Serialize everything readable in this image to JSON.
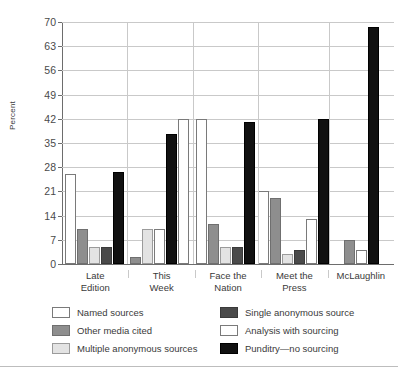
{
  "chart_data": {
    "type": "bar",
    "title_visible_fragment": "",
    "xlabel": "",
    "ylabel": "Percent",
    "ylim": [
      0,
      70
    ],
    "yticks": [
      0,
      7,
      14,
      21,
      28,
      35,
      42,
      49,
      56,
      63,
      70
    ],
    "grid": true,
    "legend_position": "bottom",
    "categories": [
      "Late Edition",
      "This Week",
      "Face the Nation",
      "Meet the Press",
      "McLaughlin"
    ],
    "series": [
      {
        "name": "Named sources",
        "color": "#ffffff",
        "values": [
          26,
          42,
          42,
          21,
          0
        ]
      },
      {
        "name": "Other media cited",
        "color": "#8e8e8e",
        "values": [
          10,
          2,
          11.5,
          19,
          7
        ]
      },
      {
        "name": "Multiple anonymous sources",
        "color": "#e3e3e3",
        "values": [
          5,
          10,
          5,
          3,
          0
        ]
      },
      {
        "name": "Single anonymous source",
        "color": "#4a4a4a",
        "values": [
          5,
          0,
          5,
          4,
          0
        ]
      },
      {
        "name": "Analysis with sourcing",
        "color": "#ffffff",
        "values": [
          0,
          10,
          0,
          13,
          4
        ]
      },
      {
        "name": "Punditry—no sourcing",
        "color": "#111111",
        "values": [
          26.5,
          37.5,
          41,
          42,
          68.5
        ]
      }
    ],
    "groups": [
      {
        "label": "Late Edition",
        "label_lines": [
          "Late",
          "Edition"
        ],
        "bars": [
          {
            "series": "Named sources",
            "value": 26,
            "swatch": "sw-named"
          },
          {
            "series": "Other media cited",
            "value": 10,
            "swatch": "sw-other"
          },
          {
            "series": "Multiple anonymous sources",
            "value": 5,
            "swatch": "sw-multi"
          },
          {
            "series": "Single anonymous source",
            "value": 5,
            "swatch": "sw-single"
          },
          {
            "series": "Punditry—no sourcing",
            "value": 26.5,
            "swatch": "sw-punditry"
          }
        ]
      },
      {
        "label": "This Week",
        "label_lines": [
          "This",
          "Week"
        ],
        "bars": [
          {
            "series": "Other media cited",
            "value": 2,
            "swatch": "sw-other"
          },
          {
            "series": "Multiple anonymous sources",
            "value": 10,
            "swatch": "sw-multi"
          },
          {
            "series": "Analysis with sourcing",
            "value": 10,
            "swatch": "sw-analysis"
          },
          {
            "series": "Punditry—no sourcing",
            "value": 37.5,
            "swatch": "sw-punditry"
          },
          {
            "series": "Named sources",
            "value": 42,
            "swatch": "sw-named"
          }
        ]
      },
      {
        "label": "Face the Nation",
        "label_lines": [
          "Face the",
          "Nation"
        ],
        "bars": [
          {
            "series": "Named sources",
            "value": 42,
            "swatch": "sw-named"
          },
          {
            "series": "Other media cited",
            "value": 11.5,
            "swatch": "sw-other"
          },
          {
            "series": "Multiple anonymous sources",
            "value": 5,
            "swatch": "sw-multi"
          },
          {
            "series": "Single anonymous source",
            "value": 5,
            "swatch": "sw-single"
          },
          {
            "series": "Punditry—no sourcing",
            "value": 41,
            "swatch": "sw-punditry"
          }
        ]
      },
      {
        "label": "Meet the Press",
        "label_lines": [
          "Meet the",
          "Press"
        ],
        "bars": [
          {
            "series": "Named sources",
            "value": 21,
            "swatch": "sw-named"
          },
          {
            "series": "Other media cited",
            "value": 19,
            "swatch": "sw-other"
          },
          {
            "series": "Multiple anonymous sources",
            "value": 3,
            "swatch": "sw-multi"
          },
          {
            "series": "Single anonymous source",
            "value": 4,
            "swatch": "sw-single"
          },
          {
            "series": "Analysis with sourcing",
            "value": 13,
            "swatch": "sw-analysis"
          },
          {
            "series": "Punditry—no sourcing",
            "value": 42,
            "swatch": "sw-punditry"
          }
        ]
      },
      {
        "label": "McLaughlin",
        "label_lines": [
          "McLaughlin",
          ""
        ],
        "bars": [
          {
            "series": "Other media cited",
            "value": 7,
            "swatch": "sw-other"
          },
          {
            "series": "Analysis with sourcing",
            "value": 4,
            "swatch": "sw-analysis"
          },
          {
            "series": "Punditry—no sourcing",
            "value": 68.5,
            "swatch": "sw-punditry"
          }
        ]
      }
    ],
    "legend": [
      {
        "label": "Named sources",
        "swatch": "sw-named"
      },
      {
        "label": "Single anonymous source",
        "swatch": "sw-single"
      },
      {
        "label": "Other media cited",
        "swatch": "sw-other"
      },
      {
        "label": "Analysis with sourcing",
        "swatch": "sw-analysis"
      },
      {
        "label": "Multiple anonymous sources",
        "swatch": "sw-multi"
      },
      {
        "label": "Punditry—no sourcing",
        "swatch": "sw-punditry"
      }
    ]
  }
}
